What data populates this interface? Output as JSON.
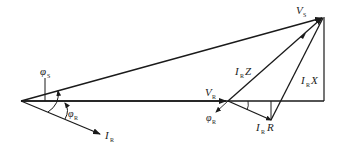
{
  "diagram": {
    "type": "phasor-diagram",
    "labels": {
      "vs": {
        "main": "V",
        "sub": "S"
      },
      "vr": {
        "main": "V",
        "sub": "R"
      },
      "ir": {
        "main": "I",
        "sub": "R"
      },
      "irz": {
        "main": "I",
        "sub": "R",
        "tail": "Z"
      },
      "irx": {
        "main": "I",
        "sub": "R",
        "tail": "X"
      },
      "irr": {
        "main": "I",
        "sub": "R",
        "tail": "R"
      },
      "phi_s": {
        "main": "φ",
        "sub": "S"
      },
      "phi_r_left": {
        "main": "φ",
        "sub": "R"
      },
      "phi_r_right": {
        "main": "φ",
        "sub": "R"
      }
    },
    "colors": {
      "line": "#1a1a1a",
      "background": "#ffffff"
    }
  }
}
